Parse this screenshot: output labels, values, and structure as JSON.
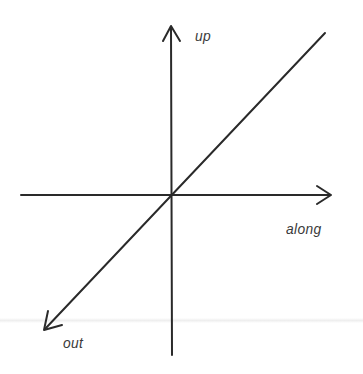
{
  "diagram": {
    "type": "3d-axes",
    "axes": [
      {
        "name": "up",
        "label": "up",
        "direction": "vertical-up"
      },
      {
        "name": "along",
        "label": "along",
        "direction": "horizontal-right"
      },
      {
        "name": "out",
        "label": "out",
        "direction": "diagonal-down-left"
      }
    ],
    "colors": {
      "line": "#2a2a2a",
      "label": "#3a3a3a",
      "background": "#ffffff"
    }
  }
}
